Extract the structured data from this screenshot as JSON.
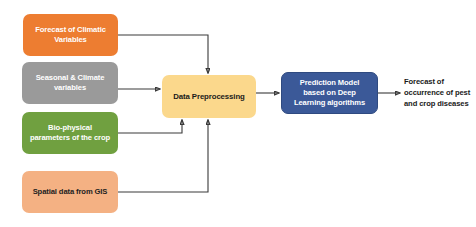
{
  "diagram": {
    "background_color": "#ffffff",
    "connector_color": "#3a3a3a",
    "inputs": [
      {
        "id": "climate",
        "label": "Forecast of Climatic Variables",
        "color": "#ED7D31",
        "text_color": "#ffffff"
      },
      {
        "id": "seasonal",
        "label": "Seasonal & Climate variables",
        "color": "#9A9A9A",
        "text_color": "#ffffff"
      },
      {
        "id": "biophysical",
        "label": "Bio-physical parameters of the crop",
        "color": "#70A040",
        "text_color": "#ffffff"
      },
      {
        "id": "gis",
        "label": "Spatial data from GIS",
        "color": "#F4B183",
        "text_color": "#222222"
      }
    ],
    "preprocessing": {
      "label": "Data Preprocessing",
      "color": "#FBD88C",
      "text_color": "#1a1a1a"
    },
    "model": {
      "label": "Prediction Model based on Deep Learning algorithms",
      "color": "#3B5998",
      "text_color": "#ffffff"
    },
    "output": {
      "label": "Forecast of occurrence of pest and crop diseases",
      "text_color": "#1a1a1a"
    }
  }
}
